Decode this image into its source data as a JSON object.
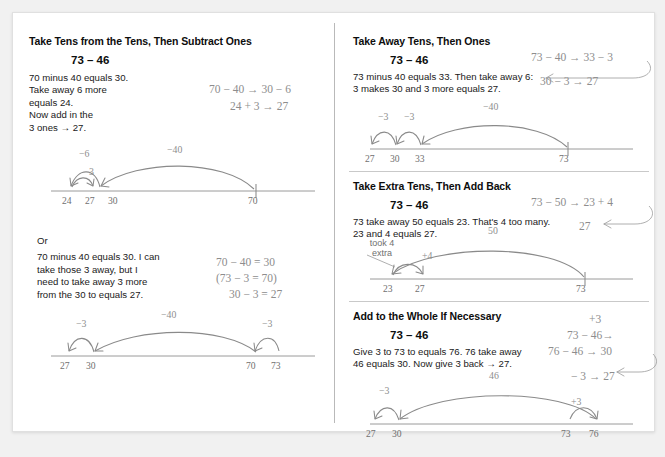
{
  "left_column": {
    "section1": {
      "title": "Take Tens from the Tens, Then Subtract Ones",
      "problem": "73 – 46",
      "explanation": "70 minus 40 equals 30.\nTake away 6 more\nequals 24.\nNow add in the\n3 ones → 27.",
      "equations": [
        "70 − 40 → 30 − 6",
        "24 + 3 → 27"
      ],
      "numberline": {
        "ticks": [
          "24",
          "27",
          "30",
          "70"
        ],
        "arc_labels": [
          "−6",
          "3",
          "−40"
        ]
      }
    },
    "section2": {
      "or_label": "Or",
      "explanation": "70 minus 40 equals 30. I can\ntake those 3 away, but I\nneed to take away 3 more\nfrom the 30 to equals 27.",
      "equations": [
        "70 − 40 = 30",
        "(73 − 3 = 70)",
        "30 − 3 = 27"
      ],
      "numberline": {
        "ticks": [
          "27",
          "30",
          "70",
          "73"
        ],
        "arc_labels": [
          "−3",
          "−40",
          "−3"
        ]
      }
    }
  },
  "right_column": {
    "section1": {
      "title": "Take Away Tens, Then Ones",
      "problem": "73 – 46",
      "explanation": "73 minus 40 equals 33. Then take away 6:\n3 makes 30 and 3 more equals 27.",
      "equations": [
        "73 − 40 → 33 − 3",
        "30 − 3 → 27"
      ],
      "numberline": {
        "ticks": [
          "27",
          "30",
          "33",
          "73"
        ],
        "arc_labels": [
          "−3",
          "−3",
          "−40"
        ]
      }
    },
    "section2": {
      "title": "Take Extra Tens, Then Add Back",
      "problem": "73 – 46",
      "explanation": "73 take away 50 equals 23. That's 4 too many.\n23 and 4 equals 27.",
      "equations": [
        "73 − 50 → 23 + 4",
        "27"
      ],
      "numberline": {
        "ticks": [
          "23",
          "27",
          "73"
        ],
        "arc_labels": [
          "+4",
          "50"
        ],
        "note": "took 4\nextra"
      }
    },
    "section3": {
      "title": "Add to the Whole If Necessary",
      "problem": "73 – 46",
      "explanation": "Give 3 to 73 to equals 76. 76 take away\n46 equals 30. Now give 3 back → 27.",
      "equations": [
        "+3",
        "73 − 46→",
        "76 − 46 → 30",
        "− 3 → 27"
      ],
      "numberline": {
        "ticks": [
          "27",
          "30",
          "73",
          "76"
        ],
        "arc_labels": [
          "−3",
          "46",
          "+3"
        ]
      }
    }
  },
  "colors": {
    "ink": "#0d0d0d",
    "body": "#1a1a1a",
    "gray": "#8d8d8d",
    "line": "#9a9a9a",
    "divider": "#b9b9b9",
    "card": "#ffffff",
    "page": "#f1f1f1"
  }
}
